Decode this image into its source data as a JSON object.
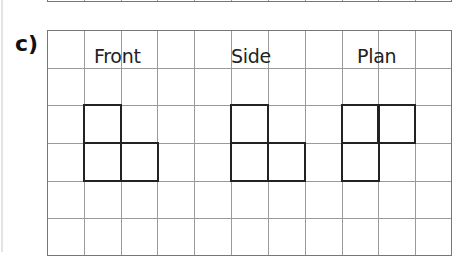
{
  "question": {
    "label": "c)"
  },
  "grid": {
    "columns": 11,
    "rows": 6
  },
  "views": [
    {
      "label": "Front",
      "label_col": 1,
      "cells": [
        [
          1,
          2
        ],
        [
          1,
          3
        ],
        [
          2,
          3
        ]
      ]
    },
    {
      "label": "Side",
      "label_col": 5,
      "cells": [
        [
          5,
          2
        ],
        [
          5,
          3
        ],
        [
          6,
          3
        ]
      ]
    },
    {
      "label": "Plan",
      "label_col": 8,
      "cells": [
        [
          8,
          2
        ],
        [
          9,
          2
        ],
        [
          8,
          3
        ]
      ]
    }
  ]
}
